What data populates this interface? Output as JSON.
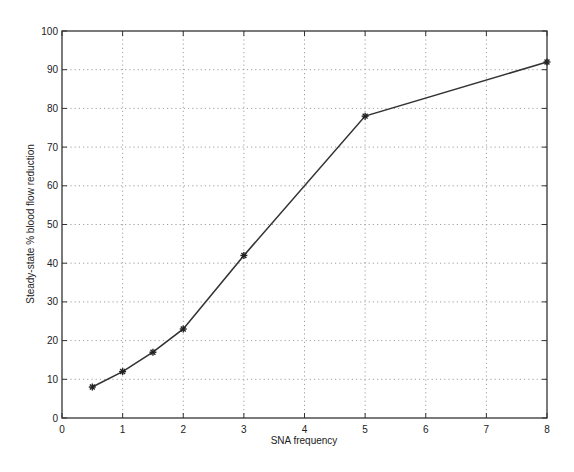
{
  "chart_data": {
    "type": "line",
    "title": "",
    "xlabel": "SNA frequency",
    "ylabel": "Steady-state % blood flow reduction",
    "xlim": [
      0,
      8
    ],
    "ylim": [
      0,
      100
    ],
    "xticks": [
      0,
      1,
      2,
      3,
      4,
      5,
      6,
      7,
      8
    ],
    "yticks": [
      0,
      10,
      20,
      30,
      40,
      50,
      60,
      70,
      80,
      90,
      100
    ],
    "grid": true,
    "legend": null,
    "marker": "asterisk",
    "series": [
      {
        "name": "blood flow reduction",
        "x": [
          0.5,
          1,
          1.5,
          2,
          3,
          5,
          8
        ],
        "y": [
          8,
          12,
          17,
          23,
          42,
          78,
          92
        ]
      }
    ]
  },
  "colors": {
    "line": "#333333",
    "axis": "#333333",
    "grid": "#888888",
    "background": "#ffffff"
  }
}
